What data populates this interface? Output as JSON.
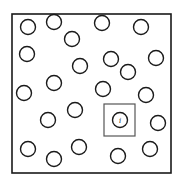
{
  "diagram": {
    "frame": {
      "x": 12,
      "y": 14,
      "width": 159,
      "height": 159
    },
    "circle_radius": 7.5,
    "circles": [
      {
        "cx": 28,
        "cy": 27
      },
      {
        "cx": 54,
        "cy": 22
      },
      {
        "cx": 72,
        "cy": 39
      },
      {
        "cx": 102,
        "cy": 23
      },
      {
        "cx": 141,
        "cy": 27
      },
      {
        "cx": 27,
        "cy": 54
      },
      {
        "cx": 111,
        "cy": 59
      },
      {
        "cx": 156,
        "cy": 58
      },
      {
        "cx": 128,
        "cy": 72
      },
      {
        "cx": 80,
        "cy": 66
      },
      {
        "cx": 54,
        "cy": 83
      },
      {
        "cx": 24,
        "cy": 93
      },
      {
        "cx": 103,
        "cy": 89
      },
      {
        "cx": 146,
        "cy": 95
      },
      {
        "cx": 75,
        "cy": 110
      },
      {
        "cx": 48,
        "cy": 120
      },
      {
        "cx": 158,
        "cy": 123
      },
      {
        "cx": 28,
        "cy": 149
      },
      {
        "cx": 54,
        "cy": 159
      },
      {
        "cx": 79,
        "cy": 147
      },
      {
        "cx": 118,
        "cy": 156
      },
      {
        "cx": 150,
        "cy": 149
      }
    ],
    "highlighted": {
      "label": "i",
      "cx": 120,
      "cy": 120,
      "box": {
        "x": 104,
        "y": 104,
        "width": 31,
        "height": 32
      }
    },
    "colors": {
      "stroke": "#1a1a1a",
      "box_stroke": "#555555",
      "background": "#ffffff"
    }
  }
}
